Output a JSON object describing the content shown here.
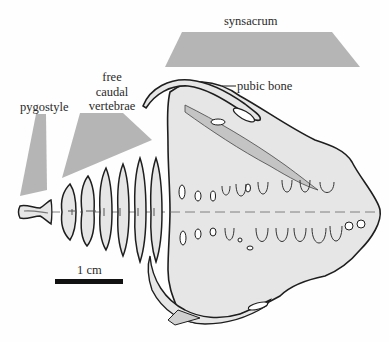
{
  "figure": {
    "labels": {
      "synsacrum": "synsacrum",
      "pubic_bone": "pubic bone",
      "free_caudal_line1": "free",
      "free_caudal_line2": "caudal",
      "free_caudal_line3": "vertebrae",
      "pygostyle": "pygostyle"
    },
    "scale_bar": {
      "label": "1 cm",
      "length_px": 68
    },
    "colors": {
      "region_marker": "#b5b5b5",
      "bone_fill": "#e6e6e6",
      "bone_shadow": "#c4c4c4",
      "outline": "#1e1e1e",
      "scale_bar": "#111111"
    }
  }
}
